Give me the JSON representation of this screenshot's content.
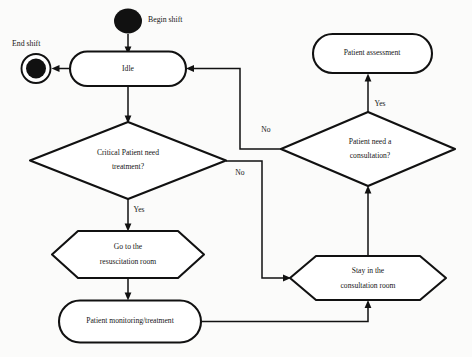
{
  "diagram": {
    "type": "activity-flowchart",
    "nodes": {
      "begin_shift": {
        "label": "Begin shift",
        "shape": "initial-node"
      },
      "end_shift": {
        "label": "End shift",
        "shape": "final-node"
      },
      "idle": {
        "label": "Idle",
        "shape": "rounded-state"
      },
      "critical_decision": {
        "line1": "Critical Patient need",
        "line2": "treatment?",
        "shape": "diamond"
      },
      "consultation_decision": {
        "line1": "Patient need a",
        "line2": "consultation?",
        "shape": "diamond"
      },
      "patient_assessment": {
        "label": "Patient assessment",
        "shape": "rounded-state"
      },
      "resuscitation_room": {
        "line1": "Go to the",
        "line2": "resuscitation room",
        "shape": "hexagon"
      },
      "consultation_room": {
        "line1": "Stay in the",
        "line2": "consultation room",
        "shape": "hexagon"
      },
      "monitoring": {
        "label": "Patient monitoring/treatment",
        "shape": "rounded-state"
      }
    },
    "edge_labels": {
      "critical_yes": "Yes",
      "critical_no": "No",
      "consultation_yes": "Yes",
      "consultation_no": "No"
    }
  }
}
